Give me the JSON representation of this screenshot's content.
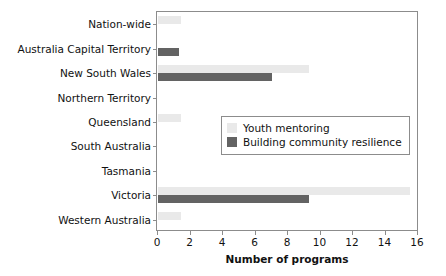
{
  "chart_data": {
    "type": "bar",
    "orientation": "horizontal",
    "title": "",
    "xlabel": "Number of programs",
    "ylabel": "",
    "xlim": [
      0,
      16
    ],
    "xticks": [
      0,
      2,
      4,
      6,
      8,
      10,
      12,
      14,
      16
    ],
    "grid": false,
    "legend_position": "center-right-inset",
    "categories": [
      "Nation-wide",
      "Australia Capital Territory",
      "New South Wales",
      "Northern Territory",
      "Queensland",
      "South Australia",
      "Tasmania",
      "Victoria",
      "Western Australia"
    ],
    "series": [
      {
        "name": "Youth mentoring",
        "color": "#e9e9e9",
        "values": [
          1.4,
          0,
          9.3,
          0,
          1.4,
          0,
          0,
          15.5,
          1.4
        ]
      },
      {
        "name": "Building community resilience",
        "color": "#636363",
        "values": [
          0,
          1.3,
          7.0,
          0,
          0,
          0,
          0,
          9.3,
          0
        ]
      }
    ]
  },
  "axis": {
    "x_title": "Number of programs",
    "tick_labels": [
      "0",
      "2",
      "4",
      "6",
      "8",
      "10",
      "12",
      "14",
      "16"
    ]
  },
  "legend": {
    "entries": [
      {
        "label": "Youth mentoring",
        "color": "#e9e9e9"
      },
      {
        "label": "Building community resilience",
        "color": "#636363"
      }
    ]
  },
  "colors": {
    "youth_mentoring": "#e9e9e9",
    "building_community_resilience": "#636363",
    "frame": "#8c8c8c",
    "background": "#ffffff",
    "text": "#111111"
  }
}
